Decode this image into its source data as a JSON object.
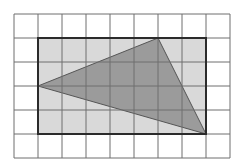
{
  "diagram": {
    "type": "grid-geometry",
    "grid": {
      "columns": 9,
      "rows": 6,
      "cell_size_px": 24,
      "origin_px": [
        14,
        14
      ],
      "line_color": "#6e6e6e"
    },
    "rectangle": {
      "grid_from": [
        1,
        1
      ],
      "grid_to": [
        8,
        5
      ],
      "width_units": 7,
      "height_units": 4,
      "fill": "#d9d9d9",
      "stroke": "#2b2b2b"
    },
    "triangle": {
      "vertices_grid": [
        [
          1,
          3
        ],
        [
          6,
          1
        ],
        [
          8,
          5
        ]
      ],
      "fill": "#9b9b9b",
      "stroke": "#555555"
    }
  }
}
